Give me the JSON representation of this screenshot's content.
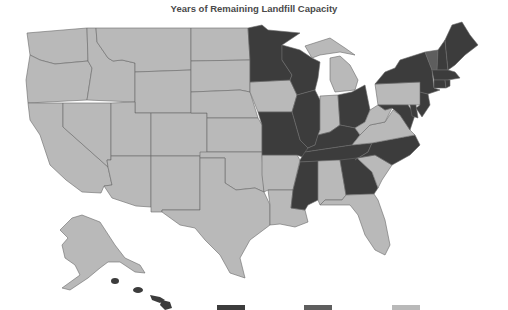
{
  "title": "Years of Remaining Landfill Capacity",
  "colors": {
    "dark": "#3c3c3c",
    "medium": "#5e5e5e",
    "light": "#b9b9b9",
    "border": "#6a6a6a",
    "background": "#ffffff"
  },
  "legend": [
    {
      "name": "dark",
      "color": "#3c3c3c"
    },
    {
      "name": "medium",
      "color": "#5e5e5e"
    },
    {
      "name": "light",
      "color": "#b9b9b9"
    }
  ],
  "states": {
    "dark": [
      "MN",
      "WI",
      "IL",
      "MO",
      "KY",
      "TN",
      "OH",
      "MS",
      "GA",
      "NC",
      "NY",
      "NJ",
      "ME",
      "NH",
      "MA",
      "CT",
      "RI",
      "DE",
      "MD",
      "HI"
    ],
    "medium": [
      "VT"
    ],
    "light": [
      "WA",
      "OR",
      "CA",
      "ID",
      "NV",
      "MT",
      "WY",
      "UT",
      "AZ",
      "CO",
      "NM",
      "ND",
      "SD",
      "NE",
      "KS",
      "OK",
      "TX",
      "IA",
      "AR",
      "LA",
      "MI",
      "IN",
      "AL",
      "FL",
      "SC",
      "VA",
      "WV",
      "PA",
      "AK"
    ]
  }
}
